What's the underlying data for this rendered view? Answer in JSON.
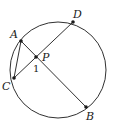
{
  "diagram": {
    "type": "geometry",
    "circle": {
      "cx": 58,
      "cy": 70,
      "r": 48
    },
    "points": {
      "A": {
        "label": "A",
        "x": 21,
        "y": 41
      },
      "B": {
        "label": "B",
        "x": 86,
        "y": 107
      },
      "C": {
        "label": "C",
        "x": 14,
        "y": 78
      },
      "D": {
        "label": "D",
        "x": 73,
        "y": 22
      },
      "P": {
        "label": "P",
        "x": 36,
        "y": 57
      }
    },
    "segments": [
      [
        "A",
        "B"
      ],
      [
        "C",
        "D"
      ],
      [
        "A",
        "C"
      ]
    ],
    "angle_label": "1",
    "colors": {
      "stroke": "#1a1a1a",
      "background": "#ffffff"
    }
  }
}
